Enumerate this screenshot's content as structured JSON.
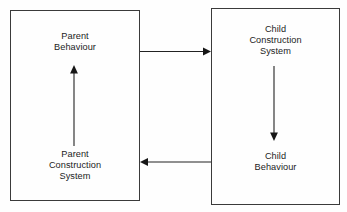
{
  "diagram": {
    "background_color": "#fefefe",
    "stroke_color": "#222222",
    "text_color": "#1c1c1c",
    "boxes": [
      {
        "id": "parent",
        "name": "Parent System Box",
        "top_label": "Parent\nBehaviour",
        "bottom_label": "Parent\nConstruction\nSystem"
      },
      {
        "id": "child",
        "name": "Child System Box",
        "top_label": "Child\nConstruction\nSystem",
        "bottom_label": "Child\nBehaviour"
      }
    ],
    "arrows": [
      {
        "id": "parent-behaviour-to-child-construction",
        "direction": "right",
        "from": "Parent Behaviour",
        "to": "Child Construction System"
      },
      {
        "id": "child-construction-to-child-behaviour",
        "direction": "down",
        "from": "Child Construction System",
        "to": "Child Behaviour"
      },
      {
        "id": "child-behaviour-to-parent-construction",
        "direction": "left",
        "from": "Child Behaviour",
        "to": "Parent Construction System"
      },
      {
        "id": "parent-construction-to-parent-behaviour",
        "direction": "up",
        "from": "Parent Construction System",
        "to": "Parent Behaviour"
      }
    ]
  }
}
